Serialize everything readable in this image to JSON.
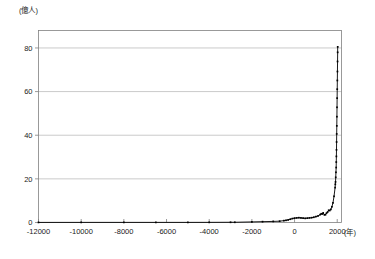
{
  "chart_data": {
    "type": "line",
    "title": "",
    "subtitle": "",
    "xlabel": "(年)",
    "ylabel": "(億人)",
    "y_unit_label": "(億人)",
    "x_unit_label": "(年)",
    "xlim": [
      -12000,
      2200
    ],
    "ylim": [
      0,
      88
    ],
    "grid": "horizontal",
    "legend": "none",
    "markers": "small filled squares",
    "line_color": "#000000",
    "grid_color": "#b3b3b3",
    "axis_color": "#808080",
    "background": "#ffffff",
    "xticks": [
      -12000,
      -10000,
      -8000,
      -6000,
      -4000,
      -2000,
      0,
      2000
    ],
    "xtick_labels": [
      "-12000",
      "-10000",
      "-8000",
      "-6000",
      "-4000",
      "-2000",
      "0",
      "2000"
    ],
    "yticks": [
      0,
      20,
      40,
      60,
      80
    ],
    "ytick_labels": [
      "0",
      "20",
      "40",
      "60",
      "80"
    ],
    "series": [
      {
        "name": "世界人口",
        "x": [
          -12000,
          -10000,
          -8000,
          -6500,
          -5000,
          -4000,
          -3000,
          -2800,
          -2000,
          -1500,
          -1000,
          -700,
          -500,
          -400,
          -300,
          -200,
          -100,
          0,
          100,
          200,
          300,
          400,
          500,
          600,
          700,
          800,
          900,
          1000,
          1100,
          1200,
          1250,
          1300,
          1340,
          1400,
          1450,
          1500,
          1550,
          1600,
          1650,
          1700,
          1750,
          1800,
          1850,
          1900,
          1910,
          1920,
          1930,
          1940,
          1950,
          1955,
          1960,
          1965,
          1970,
          1975,
          1980,
          1985,
          1990,
          1995,
          2000,
          2005,
          2010,
          2015,
          2020,
          2022
        ],
        "y": [
          0.04,
          0.05,
          0.05,
          0.05,
          0.05,
          0.07,
          0.1,
          0.1,
          0.27,
          0.38,
          0.5,
          0.6,
          0.85,
          1.0,
          1.2,
          1.5,
          1.8,
          2.0,
          2.1,
          2.2,
          2.1,
          2.0,
          1.9,
          2.0,
          2.1,
          2.2,
          2.4,
          2.7,
          3.0,
          3.6,
          4.0,
          3.9,
          4.4,
          3.5,
          3.6,
          4.3,
          4.8,
          5.6,
          5.5,
          6.0,
          7.2,
          9.0,
          12.0,
          16.0,
          17.5,
          18.6,
          20.7,
          23.0,
          25.2,
          27.7,
          30.3,
          33.3,
          36.9,
          40.6,
          44.3,
          48.5,
          52.8,
          57.0,
          61.1,
          65.1,
          69.2,
          73.8,
          78.0,
          80.5
        ],
        "y_max": 81.0,
        "y_min": 0.04
      }
    ]
  }
}
